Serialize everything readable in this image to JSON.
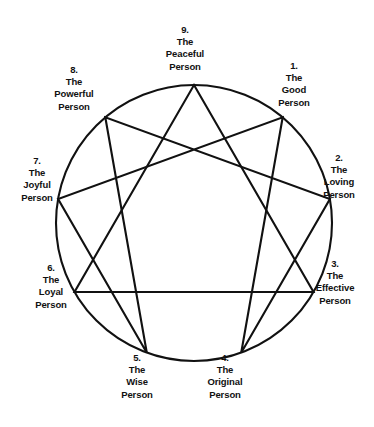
{
  "diagram": {
    "name": "Enneagram",
    "shape": "circle-with-inscribed-triangle-and-hexad",
    "stroke_color": "#111111",
    "background_color": "#ffffff",
    "circle": {
      "cx": 194,
      "cy": 223,
      "r": 138
    },
    "points": [
      {
        "id": 9,
        "number": "9.",
        "line1": "The",
        "line2": "Peaceful",
        "line3": "Person",
        "angle_deg": 0,
        "x": 194.0,
        "y": 85.0
      },
      {
        "id": 1,
        "number": "1.",
        "line1": "The",
        "line2": "Good",
        "line3": "Person",
        "angle_deg": 40,
        "x": 282.7,
        "y": 117.3
      },
      {
        "id": 2,
        "number": "2.",
        "line1": "The",
        "line2": "Loving",
        "line3": "Person",
        "angle_deg": 80,
        "x": 329.9,
        "y": 199.0
      },
      {
        "id": 3,
        "number": "3.",
        "line1": "The",
        "line2": "Effective",
        "line3": "Person",
        "angle_deg": 120,
        "x": 313.5,
        "y": 292.0
      },
      {
        "id": 4,
        "number": "4.",
        "line1": "The",
        "line2": "Original",
        "line3": "Person",
        "angle_deg": 160,
        "x": 241.2,
        "y": 352.7
      },
      {
        "id": 5,
        "number": "5.",
        "line1": "The",
        "line2": "Wise",
        "line3": "Person",
        "angle_deg": 200,
        "x": 146.8,
        "y": 352.7
      },
      {
        "id": 6,
        "number": "6.",
        "line1": "The",
        "line2": "Loyal",
        "line3": "Person",
        "angle_deg": 240,
        "x": 74.5,
        "y": 292.0
      },
      {
        "id": 7,
        "number": "7.",
        "line1": "The",
        "line2": "Joyful",
        "line3": "Person",
        "angle_deg": 280,
        "x": 58.1,
        "y": 199.0
      },
      {
        "id": 8,
        "number": "8.",
        "line1": "The",
        "line2": "Powerful",
        "line3": "Person",
        "angle_deg": 320,
        "x": 105.3,
        "y": 117.3
      }
    ],
    "triangle_path": [
      9,
      3,
      6
    ],
    "hexad_path": [
      1,
      4,
      2,
      8,
      5,
      7
    ]
  }
}
